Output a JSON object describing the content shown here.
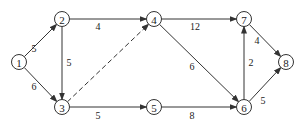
{
  "diagram": {
    "type": "directed-network",
    "nodes": [
      {
        "id": "1",
        "label": "1",
        "x": 19,
        "y": 62
      },
      {
        "id": "2",
        "label": "2",
        "x": 62,
        "y": 19
      },
      {
        "id": "3",
        "label": "3",
        "x": 62,
        "y": 107
      },
      {
        "id": "4",
        "label": "4",
        "x": 154,
        "y": 19
      },
      {
        "id": "5",
        "label": "5",
        "x": 154,
        "y": 107
      },
      {
        "id": "6",
        "label": "6",
        "x": 244,
        "y": 107
      },
      {
        "id": "7",
        "label": "7",
        "x": 244,
        "y": 19
      },
      {
        "id": "8",
        "label": "8",
        "x": 286,
        "y": 62
      }
    ],
    "edges": [
      {
        "from": "1",
        "to": "2",
        "weight": "5",
        "style": "solid",
        "lx": 34,
        "ly": 48
      },
      {
        "from": "1",
        "to": "3",
        "weight": "6",
        "style": "solid",
        "lx": 34,
        "ly": 86
      },
      {
        "from": "2",
        "to": "3",
        "weight": "5",
        "style": "solid",
        "lx": 69,
        "ly": 62
      },
      {
        "from": "2",
        "to": "4",
        "weight": "4",
        "style": "solid",
        "lx": 98,
        "ly": 26
      },
      {
        "from": "3",
        "to": "4",
        "weight": "",
        "style": "dashed",
        "lx": 0,
        "ly": 0
      },
      {
        "from": "3",
        "to": "5",
        "weight": "5",
        "style": "solid",
        "lx": 98,
        "ly": 115
      },
      {
        "from": "4",
        "to": "7",
        "weight": "12",
        "style": "solid",
        "lx": 195,
        "ly": 26
      },
      {
        "from": "4",
        "to": "6",
        "weight": "6",
        "style": "solid",
        "lx": 192,
        "ly": 66
      },
      {
        "from": "5",
        "to": "6",
        "weight": "8",
        "style": "solid",
        "lx": 192,
        "ly": 115
      },
      {
        "from": "6",
        "to": "7",
        "weight": "2",
        "style": "solid",
        "lx": 251,
        "ly": 62
      },
      {
        "from": "7",
        "to": "8",
        "weight": "4",
        "style": "solid",
        "lx": 257,
        "ly": 40
      },
      {
        "from": "6",
        "to": "8",
        "weight": "5",
        "style": "solid",
        "lx": 263,
        "ly": 100
      }
    ]
  }
}
